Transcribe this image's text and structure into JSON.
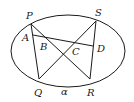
{
  "diagram": {
    "type": "geometry",
    "stroke_color": "#1a1a1a",
    "background": "#ffffff",
    "ellipse": {
      "cx": 68,
      "cy": 51,
      "rx": 57,
      "ry": 36
    },
    "points": {
      "P": {
        "x": 31,
        "y": 24
      },
      "S": {
        "x": 96,
        "y": 21
      },
      "Q": {
        "x": 39,
        "y": 79
      },
      "R": {
        "x": 90,
        "y": 79
      },
      "A": {
        "x": 33,
        "y": 35
      },
      "D": {
        "x": 93,
        "y": 46
      }
    },
    "segments": [
      [
        "P",
        "Q"
      ],
      [
        "S",
        "R"
      ],
      [
        "P",
        "R"
      ],
      [
        "S",
        "Q"
      ],
      [
        "A",
        "D"
      ]
    ],
    "labels": {
      "P": "P",
      "S": "S",
      "A": "A",
      "B": "B",
      "C": "C",
      "D": "D",
      "Q": "Q",
      "R": "R",
      "alpha": "α"
    }
  }
}
